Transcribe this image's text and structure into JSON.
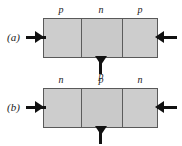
{
  "figure": {
    "caption_style": "italic-parenthetical",
    "background_color": "#ffffff",
    "region_fill_color": "#cccccc",
    "region_border_color": "#595959",
    "terminal_color": "#111111"
  },
  "panels": [
    {
      "id": "a",
      "label": "(a)",
      "device_type": "pnp",
      "regions": [
        {
          "name": "emitter",
          "doping": "p"
        },
        {
          "name": "base",
          "doping": "n"
        },
        {
          "name": "collector",
          "doping": "p"
        }
      ],
      "terminals": [
        {
          "name": "emitter-terminal",
          "position": "left",
          "arrow": "right"
        },
        {
          "name": "collector-terminal",
          "position": "right",
          "arrow": "left"
        },
        {
          "name": "base-terminal",
          "position": "bottom",
          "arrow": "down"
        }
      ],
      "base_lead_label": "p"
    },
    {
      "id": "b",
      "label": "(b)",
      "device_type": "npn",
      "regions": [
        {
          "name": "emitter",
          "doping": "n"
        },
        {
          "name": "base",
          "doping": "p"
        },
        {
          "name": "collector",
          "doping": "n"
        }
      ],
      "terminals": [
        {
          "name": "emitter-terminal",
          "position": "left",
          "arrow": "right"
        },
        {
          "name": "collector-terminal",
          "position": "right",
          "arrow": "left"
        },
        {
          "name": "base-terminal",
          "position": "bottom",
          "arrow": "down"
        }
      ],
      "base_lead_label": ""
    }
  ]
}
